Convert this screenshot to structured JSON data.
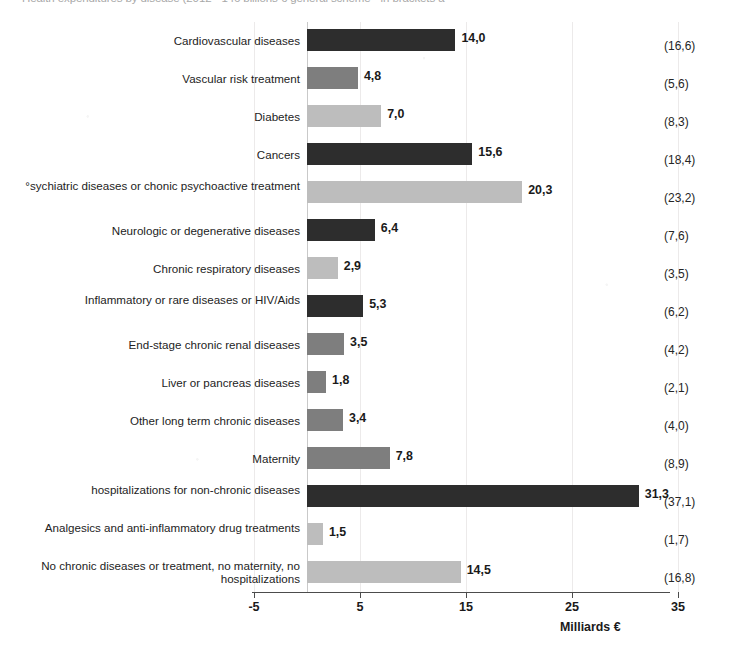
{
  "chart_data": {
    "type": "bar",
    "orientation": "horizontal",
    "title": "Health expenditures by disease (2012 - 146 billions € general scheme - in brackets a",
    "xlabel": "Milliards €",
    "ylabel": "",
    "xlim": [
      -5,
      35
    ],
    "xticks": [
      "-5",
      "5",
      "15",
      "25",
      "35"
    ],
    "grid": true,
    "legend": "none",
    "value_format": "comma-decimal",
    "categories": [
      "Cardiovascular diseases",
      "Vascular risk treatment",
      "Diabetes",
      "Cancers",
      "°sychiatric diseases or chonic psychoactive treatment",
      "Neurologic or degenerative diseases",
      "Chronic respiratory diseases",
      "Inflammatory or rare diseases or HIV/Aids",
      "End-stage chronic renal diseases",
      "Liver or pancreas diseases",
      "Other long term chronic diseases",
      "Maternity",
      "hospitalizations for non-chronic diseases",
      "Analgesics and anti-inflammatory drug treatments",
      "No chronic diseases or treatment, no maternity, no  hospitalizations"
    ],
    "values": [
      14.0,
      4.8,
      7.0,
      15.6,
      20.3,
      6.4,
      2.9,
      5.3,
      3.5,
      1.8,
      3.4,
      7.8,
      31.3,
      1.5,
      14.5
    ],
    "value_labels": [
      "14,0",
      "4,8",
      "7,0",
      "15,6",
      "20,3",
      "6,4",
      "2,9",
      "5,3",
      "3,5",
      "1,8",
      "3,4",
      "7,8",
      "31,3",
      "1,5",
      "14,5"
    ],
    "bracket_labels": [
      "(16,6)",
      "(5,6)",
      "(8,3)",
      "(18,4)",
      "(23,2)",
      "(7,6)",
      "(3,5)",
      "(6,2)",
      "(4,2)",
      "(2,1)",
      "(4,0)",
      "(8,9)",
      "(37,1)",
      "(1,7)",
      "(16,8)"
    ],
    "bar_shades": [
      "dark",
      "mid",
      "light",
      "dark",
      "light",
      "dark",
      "light",
      "dark",
      "mid",
      "mid",
      "mid",
      "mid",
      "dark",
      "light",
      "light"
    ],
    "colors": {
      "dark": "#2d2d2d",
      "mid": "#7e7e7e",
      "light": "#bdbdbd",
      "axis": "#4c4c4c",
      "grid": "#eceaea",
      "text": "#1a1a1a"
    }
  }
}
